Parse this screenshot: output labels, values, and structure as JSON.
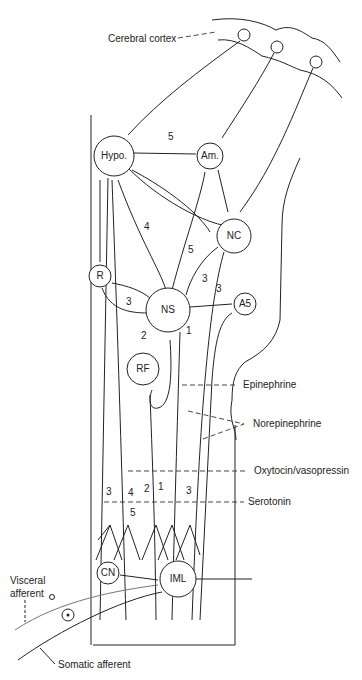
{
  "diagram": {
    "title_labels": {
      "cortex": "Cerebral cortex",
      "visceral_afferent_line1": "Visceral",
      "visceral_afferent_line2": "afferent",
      "somatic_afferent": "Somatic afferent"
    },
    "nodes": {
      "hypo": "Hypo.",
      "am": "Am.",
      "nc": "NC",
      "r": "R",
      "ns": "NS",
      "a5": "A5",
      "rf": "RF",
      "cn": "CN",
      "iml": "IML"
    },
    "pathway_numbers": {
      "hypo_am": "5",
      "hypo_ns": "4",
      "nc_ns_5": "5",
      "nc_ns_3": "3",
      "r_ns": "3",
      "a5_ns": "3",
      "ns_rf": "2",
      "ns_down": "1",
      "col_3_left": "3",
      "col_4": "4",
      "col_2": "2",
      "col_1": "1",
      "col_3_right": "3",
      "col_5": "5"
    },
    "legend": {
      "epinephrine": "Epinephrine",
      "norepinephrine": "Norepinephrine",
      "oxytocin": "Oxytocin/vasopressin",
      "serotonin": "Serotonin"
    }
  }
}
